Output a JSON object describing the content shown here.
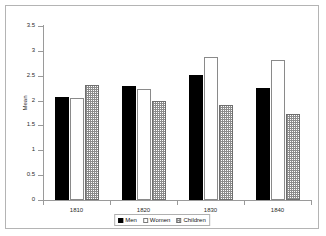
{
  "chart_data": {
    "type": "bar",
    "title": "",
    "xlabel": "",
    "ylabel": "Mean",
    "categories": [
      "1810",
      "1820",
      "1830",
      "1840"
    ],
    "series": [
      {
        "name": "Men",
        "values": [
          2.07,
          2.3,
          2.51,
          2.25
        ]
      },
      {
        "name": "Women",
        "values": [
          2.05,
          2.24,
          2.88,
          2.82
        ]
      },
      {
        "name": "Children",
        "values": [
          2.31,
          1.99,
          1.91,
          1.73
        ]
      }
    ],
    "ylim": [
      0,
      3.5
    ],
    "yticks": [
      "0",
      "0.5",
      "1",
      "1.5",
      "2",
      "2.5",
      "3",
      "3.5"
    ],
    "ytick_values": [
      0,
      0.5,
      1,
      1.5,
      2,
      2.5,
      3,
      3.5
    ],
    "grid": false,
    "legend_position": "bottom"
  }
}
